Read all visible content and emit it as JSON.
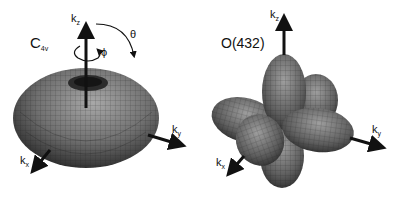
{
  "panels": [
    {
      "id": "c4v",
      "title": "C",
      "title_sub": "4v",
      "axes": {
        "z": "k",
        "z_sub": "z",
        "y": "k",
        "y_sub": "y",
        "x": "k",
        "x_sub": "x"
      },
      "angles": {
        "polar": "θ",
        "azimuthal": "ϕ"
      },
      "shape": "torus"
    },
    {
      "id": "o432",
      "title": "O(432)",
      "axes": {
        "z": "k",
        "z_sub": "z",
        "y": "k",
        "y_sub": "y",
        "x": "k",
        "x_sub": "x"
      },
      "shape": "six-lobed"
    }
  ],
  "colors": {
    "surface_dark": "#2a2a2a",
    "surface_mid": "#6a6a6a",
    "surface_light": "#9a9a9a",
    "axis": "#111111"
  }
}
